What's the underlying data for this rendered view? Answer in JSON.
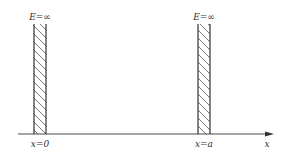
{
  "diagram": {
    "left_wall": {
      "top_label": "E=∞",
      "bottom_label": "x=0"
    },
    "right_wall": {
      "top_label": "E=∞",
      "bottom_label": "x=a"
    },
    "axis": {
      "label": "x"
    },
    "colors": {
      "line": "#333333",
      "hatch": "#555555",
      "background": "#ffffff"
    }
  }
}
